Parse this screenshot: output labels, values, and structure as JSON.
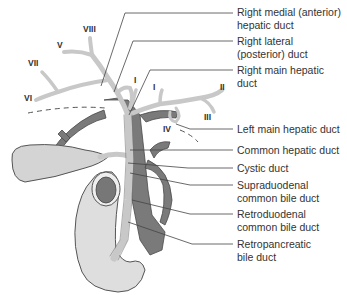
{
  "diagram": {
    "labels": {
      "right_medial": [
        "Right medial (anterior)",
        "hepatic duct"
      ],
      "right_lateral": [
        "Right lateral",
        "(posterior) duct"
      ],
      "right_main": [
        "Right main hepatic",
        "duct"
      ],
      "left_main": [
        "Left main hepatic duct"
      ],
      "common_hepatic": [
        "Common hepatic duct"
      ],
      "cystic": [
        "Cystic duct"
      ],
      "supraduodenal": [
        "Supraduodenal",
        "common bile duct"
      ],
      "retroduodenal": [
        "Retroduodenal",
        "common bile duct"
      ],
      "retropancreatic": [
        "Retropancreatic",
        "bile duct"
      ]
    },
    "segments": {
      "VIII": "VIII",
      "V": "V",
      "VII": "VII",
      "VI": "VI",
      "I_right": "I",
      "I_left": "I",
      "II": "II",
      "III": "III",
      "IV": "IV"
    },
    "colors": {
      "duct": "#c8c8c8",
      "vessel": "#7a7a7a",
      "organ": "#d9d9d9",
      "outline": "#555555",
      "text": "#333333"
    }
  }
}
